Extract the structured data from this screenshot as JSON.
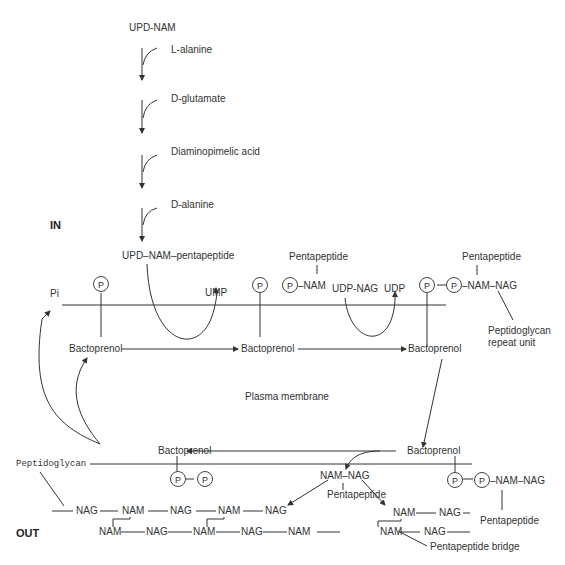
{
  "regions": {
    "inside": "IN",
    "outside": "OUT",
    "membrane": "Plasma membrane"
  },
  "cytoplasm_steps": {
    "start": "UPD-NAM",
    "additions": [
      "L-alanine",
      "D-glutamate",
      "Diaminopimelic acid",
      "D-alanine"
    ],
    "product": "UPD–NAM–pentapeptide"
  },
  "membrane_cycle": {
    "pi": "Pi",
    "ump": "UMP",
    "udp_nag": "UDP-NAG",
    "udp": "UDP",
    "bactoprenol": "Bactoprenol",
    "pentapeptide": "Pentapeptide",
    "nam": "–NAM",
    "nam_nag": "–NAM–NAG",
    "repeat_unit": "Peptidoglycan repeat unit",
    "phosphate": "P"
  },
  "outside": {
    "peptidoglycan_label": "Peptidoglycan",
    "nam_nag": "NAM–NAG",
    "pentapeptide": "Pentapeptide",
    "bridge": "Pentapeptide bridge",
    "chain_top": [
      "NAG",
      "NAM",
      "NAG",
      "NAM",
      "NAG"
    ],
    "chain_bottom": [
      "NAM",
      "NAG",
      "NAM",
      "NAG",
      "NAM",
      "NAG"
    ],
    "new_unit": [
      "NAM",
      "NAG"
    ],
    "nam": "NAM",
    "nag": "NAG"
  }
}
